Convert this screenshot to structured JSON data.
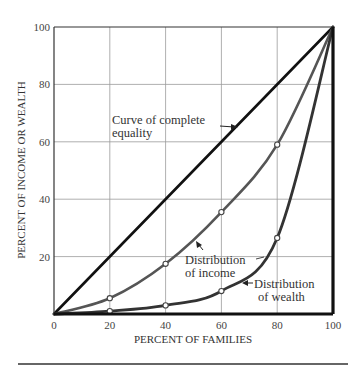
{
  "chart_data": {
    "type": "line",
    "title": "",
    "xlabel": "PERCENT OF FAMILIES",
    "ylabel": "PERCENT OF INCOME OR WEALTH",
    "xlim": [
      0,
      100
    ],
    "ylim": [
      0,
      100
    ],
    "x_ticks": [
      "0",
      "20",
      "40",
      "60",
      "80",
      "100"
    ],
    "y_ticks": [
      "20",
      "40",
      "60",
      "80",
      "100"
    ],
    "grid": true,
    "legend": "none (inline annotations with arrows)",
    "series": [
      {
        "name": "Curve of complete equality",
        "x": [
          0,
          20,
          40,
          60,
          80,
          100
        ],
        "y": [
          0,
          20,
          40,
          60,
          80,
          100
        ],
        "color": "#111111",
        "markers": false
      },
      {
        "name": "Distribution of income",
        "x": [
          0,
          20,
          40,
          60,
          80,
          100
        ],
        "y": [
          0,
          5.5,
          17.5,
          35.5,
          59,
          100
        ],
        "color": "#555555",
        "markers": true
      },
      {
        "name": "Distribution of wealth",
        "x": [
          0,
          20,
          40,
          60,
          80,
          100
        ],
        "y": [
          0,
          1,
          3,
          8,
          26.5,
          100
        ],
        "color": "#333333",
        "markers": true
      }
    ],
    "annotations": [
      {
        "text": "Curve of complete equality",
        "points_to": "equality line"
      },
      {
        "text": "Distribution of income",
        "points_to": "income curve"
      },
      {
        "text": "Distribution of wealth",
        "points_to": "wealth curve"
      }
    ]
  },
  "labels": {
    "equality_line1": "Curve of complete",
    "equality_line2": "equality",
    "income_line1": "Distribution",
    "income_line2": "of income",
    "wealth_line1": "Distribution",
    "wealth_line2": "of wealth"
  }
}
